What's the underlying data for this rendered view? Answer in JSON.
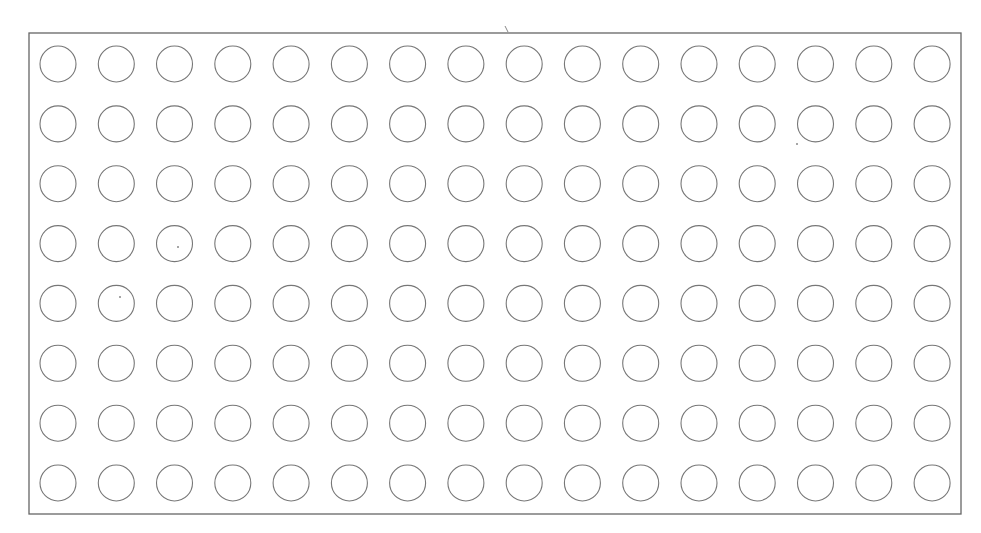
{
  "diagram": {
    "type": "circle-grid",
    "rows": 8,
    "columns": 16,
    "total_circles": 128,
    "frame": {
      "x": 29,
      "y": 33,
      "width": 932,
      "height": 481
    },
    "grid": {
      "first_center": [
        58,
        64
      ],
      "col_pitch": 58.27,
      "row_pitch": 59.86,
      "radius": 18
    },
    "stroke_color": "#777777",
    "frame_color": "#666666",
    "background": "#ffffff",
    "marks": [
      {
        "kind": "tick",
        "x": 507,
        "y": 30
      },
      {
        "kind": "dot",
        "x": 120,
        "y": 297
      },
      {
        "kind": "dot",
        "x": 797,
        "y": 144
      },
      {
        "kind": "dot",
        "x": 178,
        "y": 247
      }
    ]
  }
}
